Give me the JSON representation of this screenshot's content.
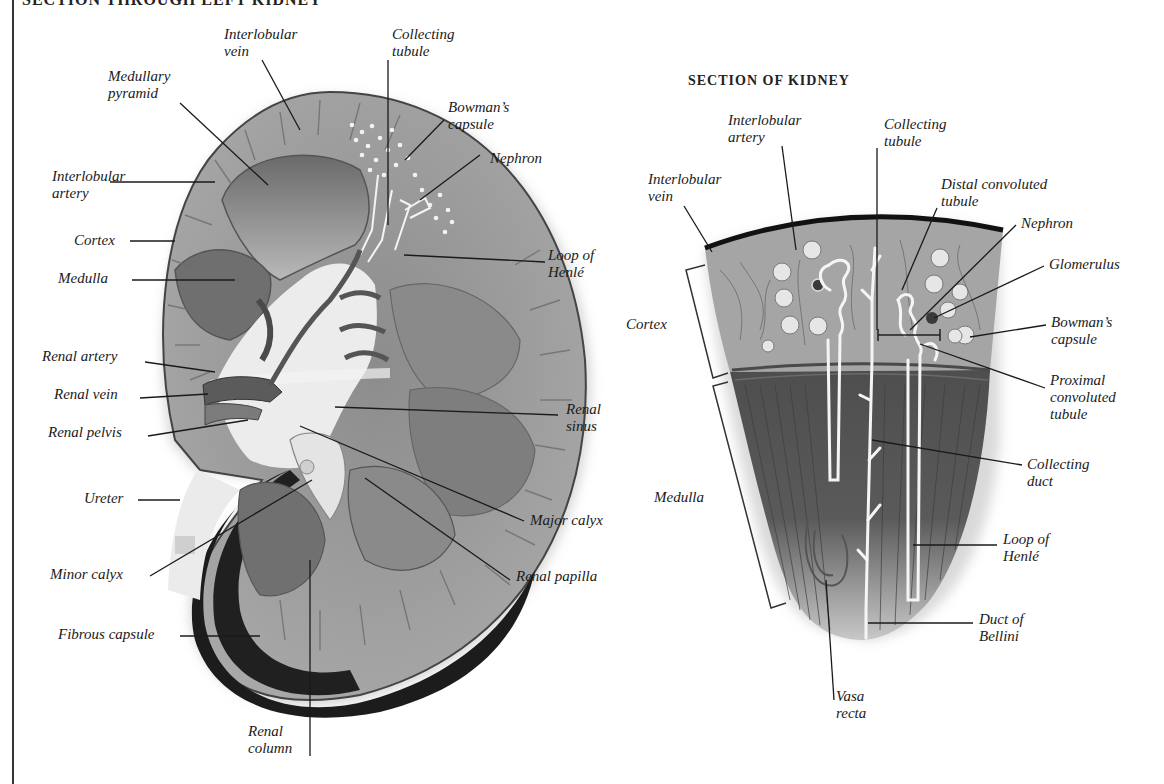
{
  "left_panel": {
    "title": "SECTION THROUGH LEFT KIDNEY",
    "labels": {
      "interlobular_vein": [
        "Interlobular",
        "vein"
      ],
      "collecting_tubule": [
        "Collecting",
        "tubule"
      ],
      "medullary_pyramid": [
        "Medullary",
        "pyramid"
      ],
      "bowmans_capsule": [
        "Bowman’s",
        "capsule"
      ],
      "nephron": "Nephron",
      "interlobular_artery": [
        "Interlobular",
        "artery"
      ],
      "cortex": "Cortex",
      "medulla": "Medulla",
      "loop_of_henle": [
        "Loop of",
        "Henlé"
      ],
      "renal_artery": "Renal artery",
      "renal_vein": "Renal vein",
      "renal_pelvis": "Renal pelvis",
      "renal_sinus": [
        "Renal",
        "sinus"
      ],
      "ureter": "Ureter",
      "major_calyx": "Major calyx",
      "minor_calyx": "Minor calyx",
      "renal_papilla": "Renal papilla",
      "fibrous_capsule": "Fibrous capsule",
      "renal_column": [
        "Renal",
        "column"
      ]
    }
  },
  "right_panel": {
    "title": "SECTION OF KIDNEY",
    "labels": {
      "interlobular_artery": [
        "Interlobular",
        "artery"
      ],
      "collecting_tubule": [
        "Collecting",
        "tubule"
      ],
      "interlobular_vein": [
        "Interlobular",
        "vein"
      ],
      "distal_convoluted_tubule": [
        "Distal convoluted",
        "tubule"
      ],
      "nephron": "Nephron",
      "glomerulus": "Glomerulus",
      "cortex": "Cortex",
      "bowmans_capsule": [
        "Bowman’s",
        "capsule"
      ],
      "proximal_convoluted_tubule": [
        "Proximal",
        "convoluted",
        "tubule"
      ],
      "collecting_duct": [
        "Collecting",
        "duct"
      ],
      "medulla": "Medulla",
      "loop_of_henle": [
        "Loop of",
        "Henlé"
      ],
      "duct_of_bellini": [
        "Duct of",
        "Bellini"
      ],
      "vasa_recta": [
        "Vasa",
        "recta"
      ]
    }
  },
  "colors": {
    "capsule_dark": "#1c1c1c",
    "cortex_gray": "#9a9a9a",
    "medulla_gray": "#6e6e6e",
    "sinus_light": "#e8e8e8",
    "tubule_white": "#f4f4f4",
    "label_ink": "#1a1a1a"
  }
}
